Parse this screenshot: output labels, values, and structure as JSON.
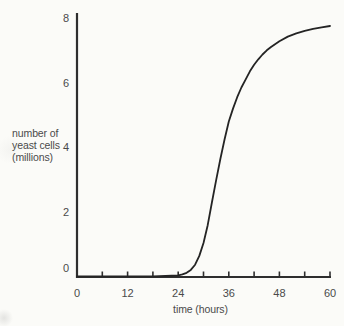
{
  "chart_data": {
    "type": "line",
    "title": "",
    "xlabel": "time (hours)",
    "ylabel_lines": [
      "number of",
      "yeast cells",
      "(millions)"
    ],
    "x": [
      0,
      6,
      12,
      18,
      21,
      24,
      25,
      26,
      27,
      28,
      29,
      30,
      31,
      32,
      33,
      34,
      35,
      36,
      37,
      38,
      39,
      40,
      41,
      42,
      43,
      44,
      45,
      46,
      48,
      50,
      52,
      54,
      56,
      58,
      60
    ],
    "y": [
      0.02,
      0.02,
      0.02,
      0.02,
      0.03,
      0.05,
      0.08,
      0.13,
      0.22,
      0.38,
      0.65,
      1.05,
      1.6,
      2.3,
      3.0,
      3.65,
      4.25,
      4.8,
      5.2,
      5.55,
      5.85,
      6.1,
      6.35,
      6.55,
      6.72,
      6.87,
      7.0,
      7.1,
      7.28,
      7.42,
      7.52,
      7.6,
      7.66,
      7.71,
      7.75
    ],
    "xlim": [
      0,
      60
    ],
    "ylim": [
      0,
      8.15
    ],
    "xticks_labeled": [
      0,
      12,
      24,
      36,
      48,
      60
    ],
    "xticks_minor": [
      6,
      18,
      30,
      42,
      54
    ],
    "yticks": [
      0,
      2,
      4,
      6,
      8
    ],
    "grid": false,
    "legend": "none",
    "colors": {
      "line": "#242424",
      "axis": "#2e2e2e",
      "text": "#4a4a4a",
      "background": "#fbfbf8"
    }
  }
}
